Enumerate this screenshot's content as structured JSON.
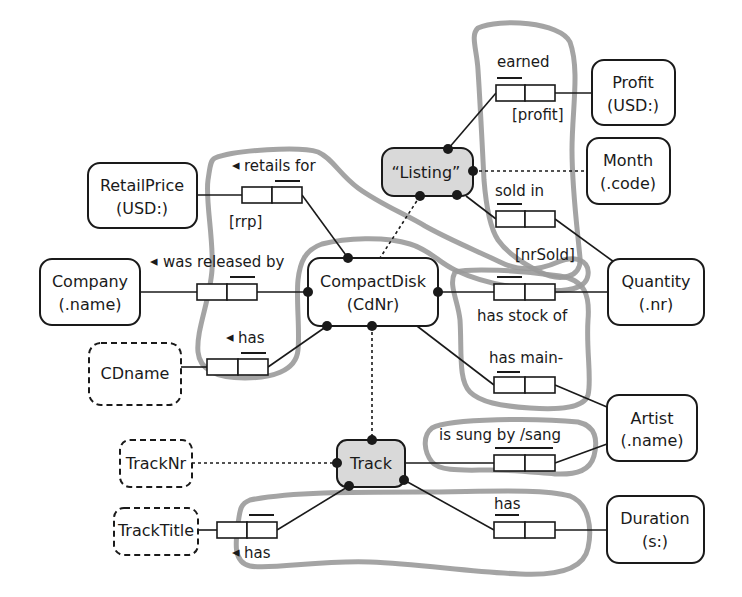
{
  "diagram": {
    "entities": {
      "profit": {
        "name": "Profit",
        "ref": "(USD:)"
      },
      "month": {
        "name": "Month",
        "ref": "(.code)"
      },
      "listing": {
        "name": "“Listing”"
      },
      "retail_price": {
        "name": "RetailPrice",
        "ref": "(USD:)"
      },
      "company": {
        "name": "Company",
        "ref": "(.name)"
      },
      "compact_disk": {
        "name": "CompactDisk",
        "ref": "(CdNr)"
      },
      "quantity": {
        "name": "Quantity",
        "ref": "(.nr)"
      },
      "cdname": {
        "name": "CDname"
      },
      "artist": {
        "name": "Artist",
        "ref": "(.name)"
      },
      "track_nr": {
        "name": "TrackNr"
      },
      "track": {
        "name": "Track"
      },
      "track_title": {
        "name": "TrackTitle"
      },
      "duration": {
        "name": "Duration",
        "ref": "(s:)"
      }
    },
    "fact_types": {
      "earned": {
        "reading": "earned",
        "role_name": "[profit]"
      },
      "sold_in": {
        "reading": "sold in",
        "role_name": "[nrSold]"
      },
      "retails_for": {
        "arrow": "◂",
        "reading": "retails for",
        "role_name": "[rrp]"
      },
      "was_released_by": {
        "arrow": "◂",
        "reading": "was released by"
      },
      "has_cdname": {
        "arrow": "◂",
        "reading": "has"
      },
      "has_stock_of": {
        "reading": "has stock of"
      },
      "has_main_artist": {
        "reading": "has main-"
      },
      "is_sung_by": {
        "reading": "is sung by /sang"
      },
      "has_duration": {
        "reading": "has"
      },
      "has_track_title": {
        "arrow": "◂",
        "reading": "has"
      }
    },
    "colors": {
      "stroke": "#1a1a1a",
      "objectified_fill": "#d9d9d9",
      "highlight": "#9a9a9a",
      "background": "#ffffff"
    }
  }
}
